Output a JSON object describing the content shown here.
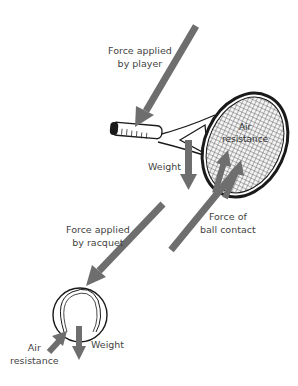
{
  "colors": {
    "arrow": "#6e6e6e",
    "outline": "#1a1a1a",
    "text": "#444444"
  },
  "labels": {
    "force_player": [
      "Force applied",
      "by player"
    ],
    "weight_racquet": "Weight",
    "air_resistance_racquet": [
      "Air",
      "resistance"
    ],
    "force_ball_contact": [
      "Force of",
      "ball contact"
    ],
    "force_racquet": [
      "Force applied",
      "by racquet"
    ],
    "air_resistance_ball": [
      "Air",
      "resistance"
    ],
    "weight_ball": "Weight"
  }
}
